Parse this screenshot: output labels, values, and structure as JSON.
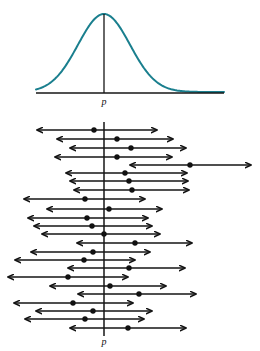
{
  "figure": {
    "title": "",
    "parameter_symbol": "p",
    "colors": {
      "curve": "#1a7f8e",
      "axis": "#161616",
      "interval": "#141414",
      "dot": "#111111",
      "background": "#ffffff"
    }
  },
  "top_panel": {
    "name": "sampling-distribution",
    "label": "p",
    "label_x": 104,
    "label_y": 105,
    "baseline": {
      "x1": 36,
      "x2": 224,
      "y": 93,
      "width": 1.4
    },
    "center_line": {
      "x": 104,
      "y1": 14,
      "y2": 93,
      "width": 1.3
    },
    "curve": {
      "stroke_width": 2.0,
      "mean_x": 104,
      "peak_y": 14,
      "base_y": 92,
      "left_x": 36,
      "right_x": 224,
      "sigma": 26
    }
  },
  "bottom_panel": {
    "name": "confidence-interval-plot",
    "label": "p",
    "label_x": 104,
    "label_y": 345,
    "axis": {
      "x": 104,
      "y1": 122,
      "y2": 336,
      "width": 1.5
    },
    "line_width": 1.6,
    "arrow_size": 5.2,
    "dot_radius": 2.7,
    "captures_label": "captures p",
    "misses_label": "does not capture p"
  },
  "chart_data": {
    "type": "interval",
    "xlabel": "",
    "ylabel": "",
    "parameter_value": 104,
    "legend": [
      "confidence interval",
      "sample proportion"
    ],
    "grid": false,
    "total_intervals": 25,
    "intervals_capturing": 24,
    "intervals_missing": 1,
    "intervals": [
      {
        "y": 130,
        "left": 37,
        "right": 157,
        "dot": 94,
        "captures": true
      },
      {
        "y": 139,
        "right": 173,
        "left": 57,
        "dot": 117,
        "captures": true
      },
      {
        "y": 148,
        "left": 70,
        "right": 186,
        "dot": 131,
        "captures": true
      },
      {
        "y": 157,
        "left": 55,
        "right": 172,
        "dot": 117,
        "captures": true
      },
      {
        "y": 165,
        "left": 130,
        "right": 251,
        "dot": 190,
        "captures": false
      },
      {
        "y": 173,
        "left": 66,
        "right": 187,
        "dot": 125,
        "captures": true
      },
      {
        "y": 181,
        "left": 70,
        "right": 188,
        "dot": 129,
        "captures": true
      },
      {
        "y": 190,
        "left": 74,
        "right": 189,
        "dot": 132,
        "captures": true
      },
      {
        "y": 199,
        "left": 24,
        "right": 145,
        "dot": 85,
        "captures": true
      },
      {
        "y": 209,
        "left": 47,
        "right": 162,
        "dot": 109,
        "captures": true
      },
      {
        "y": 218,
        "left": 28,
        "right": 148,
        "dot": 87,
        "captures": true
      },
      {
        "y": 226,
        "left": 34,
        "right": 152,
        "dot": 92,
        "captures": true
      },
      {
        "y": 234,
        "left": 42,
        "right": 160,
        "dot": 104,
        "captures": true
      },
      {
        "y": 243,
        "left": 77,
        "right": 192,
        "dot": 135,
        "captures": true
      },
      {
        "y": 252,
        "left": 31,
        "right": 150,
        "dot": 93,
        "captures": true
      },
      {
        "y": 260,
        "left": 15,
        "right": 135,
        "dot": 84,
        "captures": true
      },
      {
        "y": 268,
        "left": 68,
        "right": 185,
        "dot": 129,
        "captures": true
      },
      {
        "y": 277,
        "left": 8,
        "right": 128,
        "dot": 68,
        "captures": true
      },
      {
        "y": 286,
        "left": 50,
        "right": 166,
        "dot": 110,
        "captures": true
      },
      {
        "y": 294,
        "left": 78,
        "right": 196,
        "dot": 139,
        "captures": true
      },
      {
        "y": 303,
        "left": 14,
        "right": 133,
        "dot": 73,
        "captures": true
      },
      {
        "y": 311,
        "left": 36,
        "right": 152,
        "dot": 93,
        "captures": true
      },
      {
        "y": 319,
        "left": 25,
        "right": 144,
        "dot": 85,
        "captures": true
      },
      {
        "y": 328,
        "left": 70,
        "right": 186,
        "dot": 128,
        "captures": true
      }
    ]
  }
}
